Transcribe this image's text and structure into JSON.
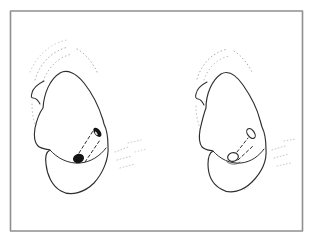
{
  "meta": {
    "colors": {
      "background": "#ffffff",
      "frame": "#8f8f8f",
      "line": "#2e2e2e",
      "opening_fill": "#141414",
      "stipple": "#3c3c3c"
    }
  },
  "frame": {
    "elements": [
      {
        "t": "rect",
        "name": "border-frame-rect",
        "x": 10.5,
        "y": 11,
        "width": 292,
        "height": 220,
        "fill": "none",
        "stroke": "#8f8f8f",
        "sw": 1.6
      }
    ]
  },
  "figures": [
    {
      "id": "left-figure",
      "description": "Heart-shaped form with dashed transmural channel; both oval openings filled solid black",
      "elements": [
        {
          "t": "path",
          "name": "stipple-halo-arc",
          "d": "M30,72 C37,55 51,43 67,40",
          "stroke": "#3c3c3c",
          "sw": 0.85,
          "dash": "0.7 3.1",
          "op": 0.3
        },
        {
          "t": "path",
          "name": "stipple-halo-arc",
          "d": "M35,80 C40,63 52,51 68,47",
          "stroke": "#3c3c3c",
          "sw": 0.85,
          "dash": "0.7 3.1",
          "op": 0.5
        },
        {
          "t": "path",
          "name": "stipple-halo-arc",
          "d": "M43,81 C49,66 59,57 72,54",
          "stroke": "#3c3c3c",
          "sw": 0.85,
          "dash": "0.7 3.1",
          "op": 0.45
        },
        {
          "t": "path",
          "name": "stipple-halo-arc",
          "d": "M77,49 C86,54 93,63 98,74",
          "stroke": "#3c3c3c",
          "sw": 0.85,
          "dash": "0.7 3.1",
          "op": 0.5
        },
        {
          "t": "path",
          "name": "stipple-shading",
          "d": "M70,79 C79,92 88,108 94,123",
          "stroke": "#3c3c3c",
          "sw": 0.85,
          "dash": "0.7 3.1",
          "op": 0.5
        },
        {
          "t": "path",
          "name": "stipple-shading",
          "d": "M76,81 C84,93 91,106 97,120",
          "stroke": "#3c3c3c",
          "sw": 0.85,
          "dash": "0.7 3.1",
          "op": 0.45
        },
        {
          "t": "path",
          "name": "stipple-shading",
          "d": "M66,82 C74,97 82,113 88,128",
          "stroke": "#3c3c3c",
          "sw": 0.85,
          "dash": "0.7 3.1",
          "op": 0.45
        },
        {
          "t": "path",
          "name": "stipple-shading",
          "d": "M82,95 C88,106 94,118 99,131",
          "stroke": "#3c3c3c",
          "sw": 0.85,
          "dash": "0.7 3.1",
          "op": 0.4
        },
        {
          "t": "path",
          "name": "stipple-shading",
          "d": "M63,95 C70,110 78,126 84,140",
          "stroke": "#3c3c3c",
          "sw": 0.85,
          "dash": "0.7 3.1",
          "op": 0.3
        },
        {
          "t": "path",
          "name": "stipple-shading",
          "d": "M47,99 C44,112 44,126 47,139",
          "stroke": "#3c3c3c",
          "sw": 0.85,
          "dash": "0.7 3.1",
          "op": 0.45
        },
        {
          "t": "path",
          "name": "stipple-shading",
          "d": "M52,95 C49,109 49,123 51,137",
          "stroke": "#3c3c3c",
          "sw": 0.85,
          "dash": "0.7 3.1",
          "op": 0.35
        },
        {
          "t": "path",
          "name": "stipple-shading",
          "d": "M32,104 C32,114 34,124 38,132",
          "stroke": "#3c3c3c",
          "sw": 0.85,
          "dash": "0.7 3.1",
          "op": 0.4
        },
        {
          "t": "path",
          "name": "stipple-shading",
          "d": "M54,166 C61,175 72,181 84,180",
          "stroke": "#3c3c3c",
          "sw": 0.85,
          "dash": "0.7 3.1",
          "op": 0.5
        },
        {
          "t": "path",
          "name": "stipple-shading",
          "d": "M59,158 C66,168 77,174 88,173",
          "stroke": "#3c3c3c",
          "sw": 0.85,
          "dash": "0.7 3.1",
          "op": 0.45
        },
        {
          "t": "path",
          "name": "stipple-shading",
          "d": "M88,170 C95,165 100,157 103,149",
          "stroke": "#3c3c3c",
          "sw": 0.85,
          "dash": "0.7 3.1",
          "op": 0.45
        },
        {
          "t": "path",
          "name": "stipple-shading",
          "d": "M66,184 C73,189 81,190 89,187",
          "stroke": "#3c3c3c",
          "sw": 0.85,
          "dash": "0.7 3.1",
          "op": 0.4
        },
        {
          "t": "path",
          "name": "motion-hatch-marks",
          "d": "M115,152 L128,147",
          "stroke": "#3c3c3c",
          "sw": 0.9,
          "dash": "0.8 2.4",
          "op": 0.35
        },
        {
          "t": "path",
          "name": "motion-hatch-marks",
          "d": "M117,160 L132,156",
          "stroke": "#3c3c3c",
          "sw": 0.9,
          "dash": "0.8 2.4",
          "op": 0.35
        },
        {
          "t": "path",
          "name": "motion-hatch-marks",
          "d": "M120,168 L135,164",
          "stroke": "#3c3c3c",
          "sw": 0.9,
          "dash": "0.8 2.4",
          "op": 0.3
        },
        {
          "t": "path",
          "name": "motion-hatch-marks",
          "d": "M128,143 L141,140",
          "stroke": "#3c3c3c",
          "sw": 0.9,
          "dash": "0.8 2.4",
          "op": 0.3
        },
        {
          "t": "path",
          "name": "motion-hatch-marks",
          "d": "M135,152 L146,149",
          "stroke": "#3c3c3c",
          "sw": 0.9,
          "dash": "0.8 2.4",
          "op": 0.25
        },
        {
          "t": "path",
          "name": "heart-outline",
          "d": "M43,108 C44,93 50,79 60,73 C67,69 76,73 84,83 C92,93 99,107 103,120 L104,124 C106,128 108,137 108,146 C109,159 103,173 94,183 C85,192 71,197 61,191 C52,186 47,175 46,164 C45,157 46,152 50,150 C46,149 41,149 38,146 C34,142 34,134 35,128 C37,119 40,112 43,108 Z",
          "fill": "#ffffff",
          "stroke": "#2e2e2e",
          "sw": 1.15
        },
        {
          "t": "path",
          "name": "vessel-stump-hook",
          "d": "M44,81 C38,84 33,88 32,93 C31,96 31,98 33,98 C36,98 38,100 40,104",
          "stroke": "#2e2e2e",
          "sw": 1.05
        },
        {
          "t": "path",
          "name": "fold-crease-line",
          "d": "M50,150 C57,158 68,164 80,163 C91,162 100,156 106,148",
          "stroke": "#2e2e2e",
          "sw": 1.0
        },
        {
          "t": "path",
          "name": "channel-dashed-edge",
          "d": "M79,153 L93,131",
          "stroke": "#2e2e2e",
          "sw": 1.0,
          "dash": "3 2.6"
        },
        {
          "t": "path",
          "name": "channel-dashed-edge",
          "d": "M85,162 L100,140",
          "stroke": "#2e2e2e",
          "sw": 1.0,
          "dash": "3 2.6"
        },
        {
          "t": "ellipse",
          "name": "channel-exit-opening-filled",
          "cx": 97.4,
          "cy": 132.3,
          "rx": 3.1,
          "ry": 5.3,
          "rot": -38,
          "fill": "#141414"
        },
        {
          "t": "ellipse",
          "name": "channel-exit-opening-highlight",
          "cx": 96.2,
          "cy": 133.4,
          "rx": 0.9,
          "ry": 2.1,
          "rot": -38,
          "fill": "#ffffff",
          "op": 0.85
        },
        {
          "t": "ellipse",
          "name": "channel-entry-opening-filled",
          "cx": 78.5,
          "cy": 158.5,
          "rx": 5.6,
          "ry": 4.6,
          "rot": -15,
          "fill": "#141414"
        }
      ]
    },
    {
      "id": "right-figure",
      "description": "Heart-shaped form with dashed transmural channel; both oval openings drawn open (white with black outline)",
      "elements": [
        {
          "t": "path",
          "name": "stipple-halo-arc",
          "d": "M197,79 C202,63 213,52 228,49",
          "stroke": "#3c3c3c",
          "sw": 0.85,
          "dash": "0.7 3.1",
          "op": 0.5
        },
        {
          "t": "path",
          "name": "stipple-halo-arc",
          "d": "M204,80 C209,66 218,58 230,56",
          "stroke": "#3c3c3c",
          "sw": 0.85,
          "dash": "0.7 3.1",
          "op": 0.4
        },
        {
          "t": "path",
          "name": "stipple-halo-arc",
          "d": "M234,51 C242,56 248,64 253,74",
          "stroke": "#3c3c3c",
          "sw": 0.85,
          "dash": "0.7 3.1",
          "op": 0.5
        },
        {
          "t": "path",
          "name": "stipple-shading",
          "d": "M228,81 C236,94 243,109 249,123",
          "stroke": "#3c3c3c",
          "sw": 0.85,
          "dash": "0.7 3.1",
          "op": 0.5
        },
        {
          "t": "path",
          "name": "stipple-shading",
          "d": "M233,84 C240,96 246,108 251,121",
          "stroke": "#3c3c3c",
          "sw": 0.85,
          "dash": "0.7 3.1",
          "op": 0.4
        },
        {
          "t": "path",
          "name": "stipple-shading",
          "d": "M224,84 C231,98 239,114 245,129",
          "stroke": "#3c3c3c",
          "sw": 0.85,
          "dash": "0.7 3.1",
          "op": 0.45
        },
        {
          "t": "path",
          "name": "stipple-shading",
          "d": "M238,97 C244,108 249,119 253,130",
          "stroke": "#3c3c3c",
          "sw": 0.85,
          "dash": "0.7 3.1",
          "op": 0.35
        },
        {
          "t": "path",
          "name": "stipple-shading",
          "d": "M208,100 C205,113 205,126 207,139",
          "stroke": "#3c3c3c",
          "sw": 0.85,
          "dash": "0.7 3.1",
          "op": 0.45
        },
        {
          "t": "path",
          "name": "stipple-shading",
          "d": "M212,96 C209,110 209,124 211,137",
          "stroke": "#3c3c3c",
          "sw": 0.85,
          "dash": "0.7 3.1",
          "op": 0.35
        },
        {
          "t": "path",
          "name": "stipple-shading",
          "d": "M196,106 C196,115 198,124 201,131",
          "stroke": "#3c3c3c",
          "sw": 0.85,
          "dash": "0.7 3.1",
          "op": 0.4
        },
        {
          "t": "path",
          "name": "stipple-shading",
          "d": "M216,168 C223,177 233,182 244,180",
          "stroke": "#3c3c3c",
          "sw": 0.85,
          "dash": "0.7 3.1",
          "op": 0.5
        },
        {
          "t": "path",
          "name": "stipple-shading",
          "d": "M221,161 C228,170 238,175 248,173",
          "stroke": "#3c3c3c",
          "sw": 0.85,
          "dash": "0.7 3.1",
          "op": 0.4
        },
        {
          "t": "path",
          "name": "stipple-shading",
          "d": "M248,171 C254,165 259,157 262,150",
          "stroke": "#3c3c3c",
          "sw": 0.85,
          "dash": "0.7 3.1",
          "op": 0.45
        },
        {
          "t": "path",
          "name": "stipple-shading",
          "d": "M226,186 C233,190 241,191 248,188",
          "stroke": "#3c3c3c",
          "sw": 0.85,
          "dash": "0.7 3.1",
          "op": 0.4
        },
        {
          "t": "path",
          "name": "motion-hatch-marks",
          "d": "M272,150 L285,146",
          "stroke": "#3c3c3c",
          "sw": 0.9,
          "dash": "0.8 2.4",
          "op": 0.35
        },
        {
          "t": "path",
          "name": "motion-hatch-marks",
          "d": "M274,158 L289,154",
          "stroke": "#3c3c3c",
          "sw": 0.9,
          "dash": "0.8 2.4",
          "op": 0.35
        },
        {
          "t": "path",
          "name": "motion-hatch-marks",
          "d": "M277,166 L291,163",
          "stroke": "#3c3c3c",
          "sw": 0.9,
          "dash": "0.8 2.4",
          "op": 0.3
        },
        {
          "t": "path",
          "name": "motion-hatch-marks",
          "d": "M284,141 L296,139",
          "stroke": "#3c3c3c",
          "sw": 0.9,
          "dash": "0.8 2.4",
          "op": 0.3
        },
        {
          "t": "path",
          "name": "heart-outline",
          "d": "M206,108 C206,94 212,80 221,74 C228,70 236,75 243,85 C250,95 257,108 260,120 L262,127 C264,131 266,140 266,149 C267,161 261,173 252,182 C243,191 230,195 221,189 C212,184 208,174 208,164 C208,157 209,153 213,151 C209,150 205,150 202,147 C199,143 199,136 200,130 C202,121 204,113 206,108 Z",
          "fill": "#ffffff",
          "stroke": "#2e2e2e",
          "sw": 1.15
        },
        {
          "t": "path",
          "name": "vessel-stump-hook",
          "d": "M207,82 C201,85 197,89 196,94 C195,97 196,99 198,99 C200,99 202,101 204,105",
          "stroke": "#2e2e2e",
          "sw": 1.05
        },
        {
          "t": "path",
          "name": "fold-crease-line",
          "d": "M213,151 C220,159 230,164 241,163 C251,162 259,156 264,149",
          "stroke": "#2e2e2e",
          "sw": 1.0
        },
        {
          "t": "path",
          "name": "channel-dashed-edge",
          "d": "M237,152 L248,138",
          "stroke": "#2e2e2e",
          "sw": 1.0,
          "dash": "3 2.6"
        },
        {
          "t": "path",
          "name": "channel-dashed-edge",
          "d": "M238,160 L253,146",
          "stroke": "#2e2e2e",
          "sw": 1.0,
          "dash": "3 2.6"
        },
        {
          "t": "ellipse",
          "name": "channel-exit-opening-open",
          "cx": 251,
          "cy": 133.5,
          "rx": 3.4,
          "ry": 5.6,
          "rot": -35,
          "fill": "#ffffff",
          "stroke": "#2e2e2e",
          "sw": 1.15
        },
        {
          "t": "ellipse",
          "name": "channel-entry-opening-open",
          "cx": 233,
          "cy": 157,
          "rx": 5.4,
          "ry": 4.3,
          "rot": -12,
          "fill": "#ffffff",
          "stroke": "#2e2e2e",
          "sw": 1.15
        },
        {
          "t": "path",
          "name": "entry-opening-shadow-arc",
          "d": "M227,162 C231,165 237,165 240,162",
          "stroke": "#2e2e2e",
          "sw": 0.8,
          "op": 0.8
        }
      ]
    }
  ]
}
